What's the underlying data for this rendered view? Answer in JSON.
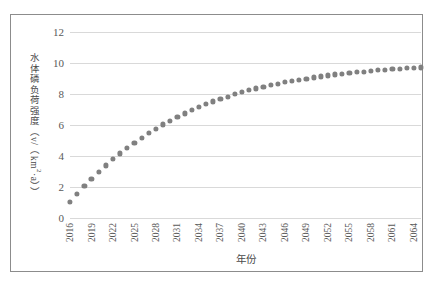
{
  "chart_data": {
    "type": "scatter",
    "title": "",
    "xlabel": "年份",
    "ylabel": "水体磷负荷强度（v/（km²·a））",
    "ylabel_text": "水体磷负荷强度（v/（km",
    "ylabel_sup": "2",
    "ylabel_tail": "·a））",
    "xlim": [
      2016,
      2065
    ],
    "ylim": [
      0,
      12
    ],
    "ytick_labels": [
      "12",
      "10",
      "8",
      "6",
      "4",
      "2",
      "0"
    ],
    "ytick_values": [
      12,
      10,
      8,
      6,
      4,
      2,
      0
    ],
    "xtick_labels": [
      "2016",
      "2019",
      "2022",
      "2025",
      "2028",
      "2031",
      "2034",
      "2037",
      "2040",
      "2043",
      "2046",
      "2049",
      "2052",
      "2055",
      "2058",
      "2061",
      "2064"
    ],
    "xtick_values": [
      2016,
      2019,
      2022,
      2025,
      2028,
      2031,
      2034,
      2037,
      2040,
      2043,
      2046,
      2049,
      2052,
      2055,
      2058,
      2061,
      2064
    ],
    "grid": true,
    "legend": "none",
    "marker_color": "#808080",
    "gridline_color": "#d9d9d9",
    "border_color": "#8c8c8c",
    "x": [
      2016,
      2017,
      2018,
      2019,
      2020,
      2021,
      2022,
      2023,
      2024,
      2025,
      2026,
      2027,
      2028,
      2029,
      2030,
      2031,
      2032,
      2033,
      2034,
      2035,
      2036,
      2037,
      2038,
      2039,
      2040,
      2041,
      2042,
      2043,
      2044,
      2045,
      2046,
      2047,
      2048,
      2049,
      2050,
      2051,
      2052,
      2053,
      2054,
      2055,
      2056,
      2057,
      2058,
      2059,
      2060,
      2061,
      2062,
      2063,
      2064,
      2065
    ],
    "values": [
      1.02,
      1.55,
      2.05,
      2.52,
      2.97,
      3.39,
      3.79,
      4.17,
      4.53,
      4.87,
      5.19,
      5.49,
      5.77,
      6.04,
      6.29,
      6.53,
      6.75,
      6.96,
      7.16,
      7.34,
      7.52,
      7.68,
      7.83,
      7.98,
      8.11,
      8.24,
      8.36,
      8.47,
      8.57,
      8.67,
      8.76,
      8.85,
      8.93,
      9.0,
      9.07,
      9.14,
      9.2,
      9.26,
      9.31,
      9.36,
      9.41,
      9.45,
      9.49,
      9.53,
      9.57,
      9.6,
      9.63,
      9.66,
      9.69,
      9.72
    ]
  }
}
